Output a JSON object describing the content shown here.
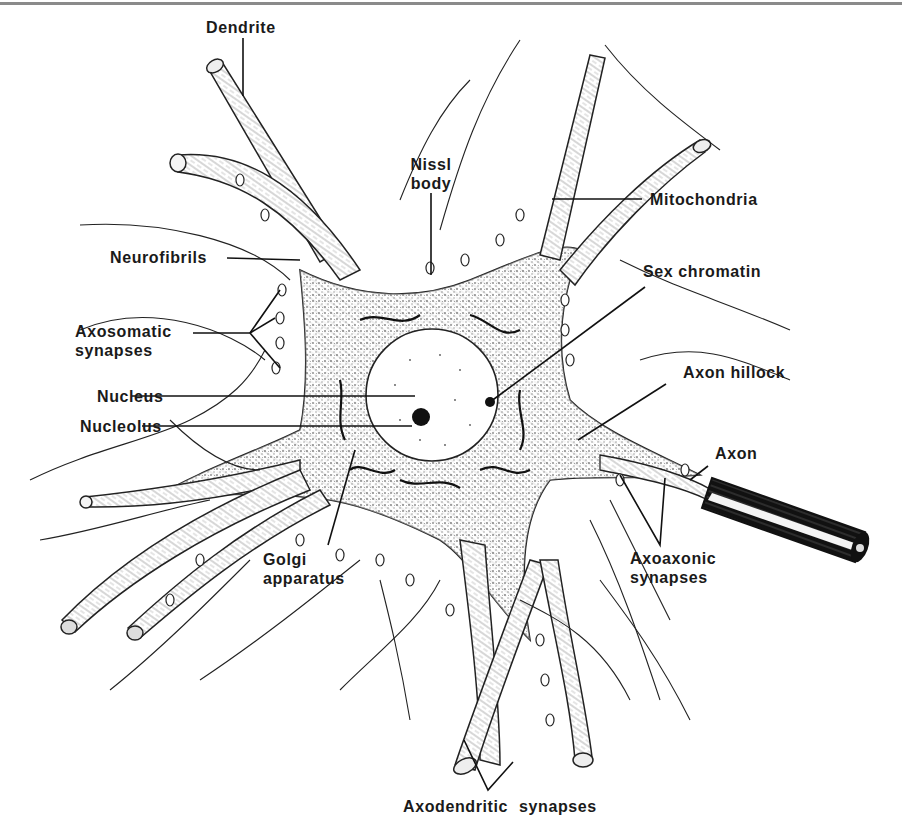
{
  "figure": {
    "labels": {
      "dendrite": "Dendrite",
      "nissl_body_line1": "Nissl",
      "nissl_body_line2": "body",
      "mitochondria": "Mitochondria",
      "neurofibrils": "Neurofibrils",
      "sex_chromatin": "Sex chromatin",
      "axosomatic_line1": "Axosomatic",
      "axosomatic_line2": "synapses",
      "nucleus": "Nucleus",
      "axon_hillock": "Axon hillock",
      "nucleolus": "Nucleolus",
      "axon": "Axon",
      "golgi_line1": "Golgi",
      "golgi_line2": "apparatus",
      "axoaxonic_line1": "Axoaxonic",
      "axoaxonic_line2": "synapses",
      "axodendritic": "Axodendritic synapses"
    },
    "colors": {
      "ink": "#1a1a1a",
      "paper": "#ffffff",
      "rule": "#8a8a8a"
    }
  }
}
